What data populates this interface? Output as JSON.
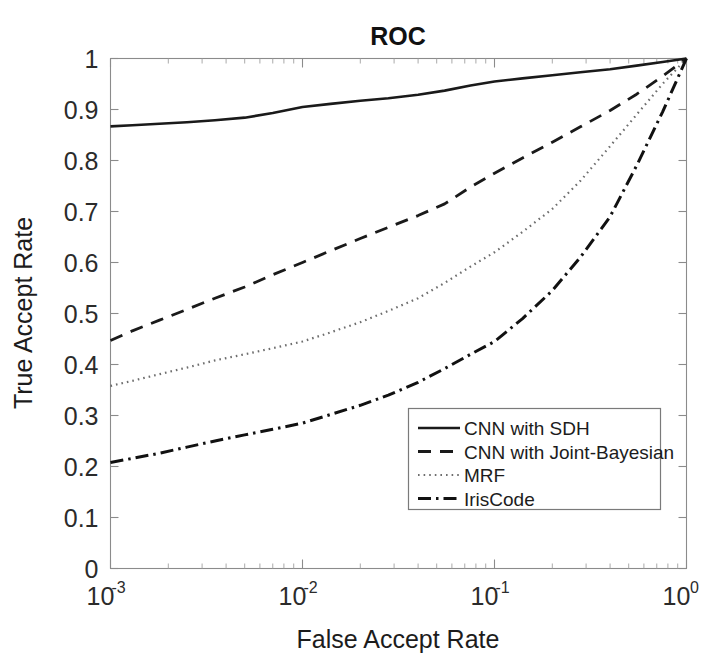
{
  "chart_data": {
    "type": "line",
    "title": "ROC",
    "xlabel": "False Accept Rate",
    "ylabel": "True Accept Rate",
    "xscale": "log",
    "yscale": "linear",
    "xlim": [
      0.001,
      1
    ],
    "ylim": [
      0,
      1
    ],
    "grid": false,
    "legend_position": "lower right",
    "xticks": [
      {
        "value": 0.001,
        "base": "10",
        "exp": "-3"
      },
      {
        "value": 0.01,
        "base": "10",
        "exp": "-2"
      },
      {
        "value": 0.1,
        "base": "10",
        "exp": "-1"
      },
      {
        "value": 1,
        "base": "10",
        "exp": "0"
      }
    ],
    "yticks": [
      "0",
      "0.1",
      "0.2",
      "0.3",
      "0.4",
      "0.5",
      "0.6",
      "0.7",
      "0.8",
      "0.9",
      "1"
    ],
    "ytick_values": [
      0,
      0.1,
      0.2,
      0.3,
      0.4,
      0.5,
      0.6,
      0.7,
      0.8,
      0.9,
      1
    ],
    "series": [
      {
        "name": "CNN with SDH",
        "style": "solid",
        "color": "#1a1a1a",
        "width": 2.6,
        "x": [
          0.001,
          0.0013,
          0.0018,
          0.0025,
          0.0035,
          0.005,
          0.007,
          0.01,
          0.014,
          0.02,
          0.028,
          0.04,
          0.055,
          0.075,
          0.1,
          0.14,
          0.2,
          0.28,
          0.4,
          0.55,
          0.75,
          1.0
        ],
        "y": [
          0.867,
          0.869,
          0.872,
          0.875,
          0.879,
          0.884,
          0.893,
          0.905,
          0.911,
          0.917,
          0.922,
          0.929,
          0.937,
          0.947,
          0.955,
          0.961,
          0.967,
          0.973,
          0.979,
          0.986,
          0.993,
          1.0
        ]
      },
      {
        "name": "CNN with Joint-Bayesian",
        "style": "dashed",
        "color": "#1a1a1a",
        "width": 2.8,
        "x": [
          0.001,
          0.0013,
          0.0018,
          0.0025,
          0.0035,
          0.005,
          0.007,
          0.01,
          0.014,
          0.02,
          0.028,
          0.04,
          0.055,
          0.075,
          0.1,
          0.14,
          0.2,
          0.28,
          0.4,
          0.55,
          0.75,
          1.0
        ],
        "y": [
          0.447,
          0.466,
          0.487,
          0.508,
          0.53,
          0.552,
          0.576,
          0.6,
          0.623,
          0.647,
          0.669,
          0.692,
          0.715,
          0.748,
          0.775,
          0.805,
          0.836,
          0.866,
          0.898,
          0.93,
          0.965,
          1.0
        ]
      },
      {
        "name": "MRF",
        "style": "dotted",
        "color": "#6e6e6e",
        "width": 2.2,
        "x": [
          0.001,
          0.0013,
          0.0018,
          0.0025,
          0.0035,
          0.005,
          0.007,
          0.01,
          0.014,
          0.02,
          0.028,
          0.04,
          0.055,
          0.075,
          0.1,
          0.14,
          0.2,
          0.28,
          0.4,
          0.55,
          0.75,
          1.0
        ],
        "y": [
          0.358,
          0.368,
          0.381,
          0.394,
          0.408,
          0.42,
          0.432,
          0.445,
          0.463,
          0.483,
          0.505,
          0.53,
          0.56,
          0.592,
          0.62,
          0.66,
          0.705,
          0.76,
          0.828,
          0.89,
          0.95,
          1.0
        ]
      },
      {
        "name": "IrisCode",
        "style": "dashdot",
        "color": "#111111",
        "width": 3.0,
        "x": [
          0.001,
          0.0013,
          0.0018,
          0.0025,
          0.0035,
          0.005,
          0.007,
          0.01,
          0.014,
          0.02,
          0.028,
          0.04,
          0.055,
          0.075,
          0.1,
          0.14,
          0.2,
          0.28,
          0.4,
          0.55,
          0.75,
          1.0
        ],
        "y": [
          0.208,
          0.216,
          0.226,
          0.238,
          0.25,
          0.262,
          0.273,
          0.285,
          0.302,
          0.32,
          0.34,
          0.365,
          0.392,
          0.42,
          0.445,
          0.49,
          0.545,
          0.61,
          0.69,
          0.79,
          0.895,
          1.0
        ]
      }
    ]
  },
  "legend": {
    "entries": [
      {
        "label": "CNN with SDH",
        "style": "solid"
      },
      {
        "label": "CNN with Joint-Bayesian",
        "style": "dashed"
      },
      {
        "label": "MRF",
        "style": "dotted"
      },
      {
        "label": "IrisCode",
        "style": "dashdot"
      }
    ]
  }
}
